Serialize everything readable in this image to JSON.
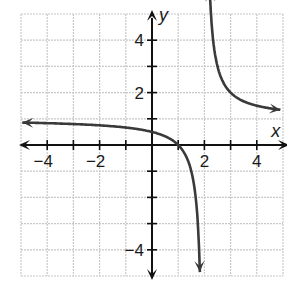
{
  "chart_data": {
    "type": "line",
    "title": "",
    "xlabel": "x",
    "ylabel": "y",
    "xlim": [
      -5,
      5
    ],
    "ylim": [
      -5,
      5
    ],
    "grid": true,
    "x_tick_labels": [
      {
        "value": -4,
        "label": "−4"
      },
      {
        "value": -2,
        "label": "−2"
      },
      {
        "value": 2,
        "label": "2"
      },
      {
        "value": 4,
        "label": "4"
      }
    ],
    "y_tick_labels": [
      {
        "value": 4,
        "label": "4"
      },
      {
        "value": 2,
        "label": "2"
      },
      {
        "value": -4,
        "label": "−4"
      }
    ],
    "function": "y = 1 + 1/(x - 2)",
    "asymptotes": {
      "vertical": 2,
      "horizontal": 1
    },
    "series": [
      {
        "name": "left branch",
        "x": [
          -5,
          -4,
          -3,
          -2,
          -1,
          0,
          0.5,
          1,
          1.5,
          1.75,
          1.8
        ],
        "y": [
          0.86,
          0.83,
          0.8,
          0.75,
          0.67,
          0.5,
          0.33,
          0,
          -1,
          -3,
          -4
        ]
      },
      {
        "name": "right branch",
        "x": [
          2.2,
          2.25,
          2.5,
          3,
          3.5,
          4,
          4.5,
          5
        ],
        "y": [
          6,
          5,
          3,
          2,
          1.67,
          1.5,
          1.4,
          1.33
        ]
      }
    ]
  },
  "colors": {
    "grid": "#c8c8c8",
    "axes": "#111111",
    "curve": "#3a3a3a"
  }
}
